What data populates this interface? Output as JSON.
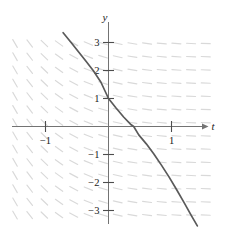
{
  "figure": {
    "kind": "slope-field-with-solution-curve",
    "width": 229,
    "height": 229,
    "background_color": "#ffffff"
  },
  "chart_data": {
    "type": "line",
    "title": "",
    "subtitle": "",
    "xlabel": "t",
    "ylabel": "y",
    "xlim": [
      -1.72,
      1.78
    ],
    "ylim": [
      -3.6,
      3.35
    ],
    "grid": false,
    "legend": null,
    "x_ticks": [
      -1,
      1
    ],
    "x_tick_labels": [
      "−1",
      "1"
    ],
    "y_ticks": [
      3,
      2,
      1,
      -1,
      -2,
      -3
    ],
    "y_tick_labels": [
      "3",
      "2",
      "1",
      "−1",
      "−2",
      "−3"
    ],
    "axis_color": "#6b6b6b",
    "curve_color": "#5a5a5a",
    "slopefield_color": "#d8d8d8",
    "series": [
      {
        "name": "solution curve",
        "description": "decreasing curve through (0, 1), crossing the t-axis near t = 0.4, steepening downward to the right",
        "x": [
          -0.72,
          -0.6,
          -0.48,
          -0.36,
          -0.24,
          -0.12,
          0.0,
          0.12,
          0.24,
          0.36,
          0.4,
          0.48,
          0.6,
          0.72,
          0.84,
          0.96,
          1.08,
          1.2,
          1.32,
          1.41
        ],
        "y": [
          3.35,
          3.02,
          2.68,
          2.34,
          1.99,
          1.58,
          1.0,
          0.66,
          0.34,
          0.06,
          0.0,
          -0.3,
          -0.62,
          -0.98,
          -1.38,
          -1.8,
          -2.25,
          -2.72,
          -3.2,
          -3.55
        ]
      }
    ],
    "slope_field": {
      "description": "short dashed tick segments on a grid; slopes steep/near-vertical on the left half, flattening toward near-horizontal in the upper right",
      "columns": 14,
      "rows": 14,
      "x_range": [
        -1.6,
        1.66
      ],
      "y_range": [
        -3.4,
        3.2
      ]
    },
    "annotations": []
  },
  "labels": {
    "y_axis": "y",
    "t_axis": "t"
  }
}
